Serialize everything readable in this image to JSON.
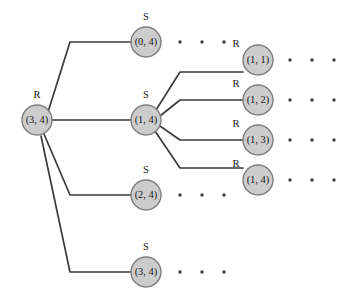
{
  "diagram": {
    "colors": {
      "node_fill": "#cccccc",
      "node_stroke": "#7d7d7d",
      "edge": "#3b3b3b",
      "text": "#1a1a1a",
      "background": "#ffffff"
    },
    "node_radius": 15,
    "nodes": [
      {
        "id": "root",
        "label": "(3, 4)",
        "player": "R",
        "player_pos": "top",
        "cx": 37,
        "cy": 120
      },
      {
        "id": "s04",
        "label": "(0, 4)",
        "player": "S",
        "player_pos": "top",
        "cx": 146,
        "cy": 42
      },
      {
        "id": "s14",
        "label": "(1, 4)",
        "player": "S",
        "player_pos": "top",
        "cx": 146,
        "cy": 120
      },
      {
        "id": "s24",
        "label": "(2, 4)",
        "player": "S",
        "player_pos": "top",
        "cx": 146,
        "cy": 195
      },
      {
        "id": "s34",
        "label": "(3, 4)",
        "player": "S",
        "player_pos": "top",
        "cx": 146,
        "cy": 272
      },
      {
        "id": "r11",
        "label": "(1, 1)",
        "player": "R",
        "player_pos": "topleft",
        "cx": 258,
        "cy": 60
      },
      {
        "id": "r12",
        "label": "(1, 2)",
        "player": "R",
        "player_pos": "topleft",
        "cx": 258,
        "cy": 100
      },
      {
        "id": "r13",
        "label": "(1, 3)",
        "player": "R",
        "player_pos": "topleft",
        "cx": 258,
        "cy": 140
      },
      {
        "id": "r14",
        "label": "(1, 4)",
        "player": "R",
        "player_pos": "topleft",
        "cx": 258,
        "cy": 180
      }
    ],
    "edges": [
      {
        "id": "edge-root-s04",
        "points": "48,112 70,42 131,42"
      },
      {
        "id": "edge-root-s14",
        "points": "52,120 131,120"
      },
      {
        "id": "edge-root-s24",
        "points": "44,134 70,195 131,195"
      },
      {
        "id": "edge-root-s34",
        "points": "41,136 70,272 131,272"
      },
      {
        "id": "edge-s14-r11",
        "points": "156,110 180,72 243,72"
      },
      {
        "id": "edge-s14-r12",
        "points": "160,116 180,100 243,100"
      },
      {
        "id": "edge-s14-r13",
        "points": "160,126 180,140 243,140"
      },
      {
        "id": "edge-s14-r14",
        "points": "155,131 180,168 243,168"
      }
    ],
    "ellipses": [
      {
        "id": "ellipsis-after-s04",
        "cy": 42,
        "cx": [
          180,
          202,
          224
        ]
      },
      {
        "id": "ellipsis-after-s24",
        "cy": 195,
        "cx": [
          180,
          202,
          224
        ]
      },
      {
        "id": "ellipsis-after-s34",
        "cy": 272,
        "cx": [
          180,
          202,
          224
        ]
      },
      {
        "id": "ellipsis-after-r11",
        "cy": 60,
        "cx": [
          290,
          312,
          334
        ]
      },
      {
        "id": "ellipsis-after-r12",
        "cy": 100,
        "cx": [
          290,
          312,
          334
        ]
      },
      {
        "id": "ellipsis-after-r13",
        "cy": 140,
        "cx": [
          290,
          312,
          334
        ]
      },
      {
        "id": "ellipsis-after-r14",
        "cy": 180,
        "cx": [
          290,
          312,
          334
        ]
      }
    ],
    "dot_radius": 1.7,
    "player_label_offsets": {
      "top": {
        "dx": 0,
        "dy": -24
      },
      "topleft": {
        "dx": -22,
        "dy": -15
      }
    }
  }
}
